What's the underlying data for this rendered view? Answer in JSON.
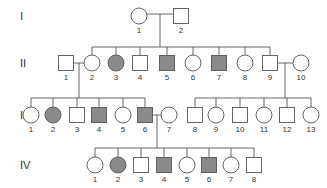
{
  "chart_data": {
    "type": "pedigree",
    "title": "",
    "colors": {
      "affected": "#8a8a8a",
      "unaffected": "#ffffff",
      "stroke": "#555555"
    },
    "generations": [
      {
        "label": "I",
        "y": 16,
        "individuals": [
          {
            "num": "1",
            "sex": "F",
            "affected": false,
            "x": 139
          },
          {
            "num": "2",
            "sex": "M",
            "affected": false,
            "x": 181
          }
        ]
      },
      {
        "label": "II",
        "y": 63,
        "individuals": [
          {
            "num": "1",
            "sex": "M",
            "affected": false,
            "x": 66
          },
          {
            "num": "2",
            "sex": "F",
            "affected": false,
            "x": 92
          },
          {
            "num": "3",
            "sex": "F",
            "affected": true,
            "x": 116
          },
          {
            "num": "4",
            "sex": "M",
            "affected": false,
            "x": 140
          },
          {
            "num": "5",
            "sex": "M",
            "affected": true,
            "x": 167
          },
          {
            "num": "6",
            "sex": "F",
            "affected": false,
            "x": 193
          },
          {
            "num": "7",
            "sex": "M",
            "affected": true,
            "x": 219
          },
          {
            "num": "8",
            "sex": "F",
            "affected": false,
            "x": 245
          },
          {
            "num": "9",
            "sex": "M",
            "affected": false,
            "x": 270
          },
          {
            "num": "10",
            "sex": "F",
            "affected": false,
            "x": 301
          }
        ]
      },
      {
        "label": "III",
        "y": 115,
        "individuals": [
          {
            "num": "1",
            "sex": "F",
            "affected": false,
            "x": 31
          },
          {
            "num": "2",
            "sex": "F",
            "affected": true,
            "x": 53
          },
          {
            "num": "3",
            "sex": "M",
            "affected": false,
            "x": 77
          },
          {
            "num": "4",
            "sex": "M",
            "affected": true,
            "x": 99
          },
          {
            "num": "5",
            "sex": "F",
            "affected": false,
            "x": 123
          },
          {
            "num": "6",
            "sex": "M",
            "affected": true,
            "x": 145
          },
          {
            "num": "7",
            "sex": "F",
            "affected": false,
            "x": 169
          },
          {
            "num": "8",
            "sex": "M",
            "affected": false,
            "x": 195
          },
          {
            "num": "9",
            "sex": "F",
            "affected": false,
            "x": 216
          },
          {
            "num": "10",
            "sex": "M",
            "affected": false,
            "x": 240
          },
          {
            "num": "11",
            "sex": "F",
            "affected": false,
            "x": 264
          },
          {
            "num": "12",
            "sex": "M",
            "affected": false,
            "x": 287
          },
          {
            "num": "13",
            "sex": "F",
            "affected": false,
            "x": 311
          }
        ]
      },
      {
        "label": "IV",
        "y": 165,
        "individuals": [
          {
            "num": "1",
            "sex": "F",
            "affected": false,
            "x": 95
          },
          {
            "num": "2",
            "sex": "F",
            "affected": true,
            "x": 118
          },
          {
            "num": "3",
            "sex": "M",
            "affected": false,
            "x": 141
          },
          {
            "num": "4",
            "sex": "M",
            "affected": true,
            "x": 164
          },
          {
            "num": "5",
            "sex": "F",
            "affected": false,
            "x": 187
          },
          {
            "num": "6",
            "sex": "M",
            "affected": true,
            "x": 209
          },
          {
            "num": "7",
            "sex": "F",
            "affected": false,
            "x": 231
          },
          {
            "num": "8",
            "sex": "M",
            "affected": false,
            "x": 254
          }
        ]
      }
    ],
    "matings": [
      {
        "partners": [
          "I-1",
          "I-2"
        ],
        "children": "II-2..II-9"
      },
      {
        "partners": [
          "II-1",
          "II-2"
        ],
        "children": "III-1..III-6"
      },
      {
        "partners": [
          "II-9",
          "II-10"
        ],
        "children": "III-8..III-13"
      },
      {
        "partners": [
          "III-6",
          "III-7"
        ],
        "children": "IV-1..IV-8"
      }
    ]
  }
}
